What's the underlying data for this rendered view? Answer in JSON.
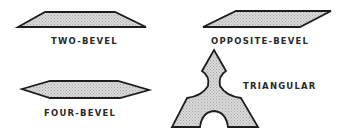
{
  "figure": {
    "labels": {
      "two_bevel": "TWO-BEVEL",
      "opposite_bevel": "OPPOSITE-BEVEL",
      "four_bevel": "FOUR-BEVEL",
      "triangular": "TRIANGULAR"
    },
    "fill_color": "#cfcfcf",
    "stroke_color": "#1d1d1d"
  }
}
